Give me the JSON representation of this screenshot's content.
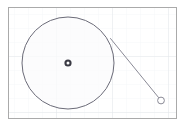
{
  "figure": {
    "type": "geometry-diagram",
    "canvas": {
      "width": 185,
      "height": 126,
      "background": "#ffffff"
    },
    "frame": {
      "label": "plot-frame",
      "x": 8.5,
      "y": 7.5,
      "width": 168,
      "height": 111,
      "stroke": "#aaaaaa",
      "stroke_width": 1,
      "fill": "#ffffff"
    },
    "grid": {
      "visible": true,
      "color": "#eef0f4",
      "spacing_x": 14,
      "spacing_y": 14,
      "stroke_width": 0.6,
      "major_color": "#e2e5ea",
      "major_every": 4
    },
    "shapes": {
      "main_circle": {
        "label": "main-circle",
        "cx": 68,
        "cy": 63,
        "r": 46,
        "stroke": "#6b6b78",
        "stroke_width": 1,
        "fill": "#fbfbfc"
      },
      "center_marker": {
        "label": "circle-center-point",
        "cx": 68,
        "cy": 63,
        "r_outer": 3.6,
        "r_inner": 1.5,
        "stroke": "#3a3a44",
        "stroke_width": 1.6,
        "fill": "#ffffff"
      },
      "tangent_line": {
        "label": "tangent-line",
        "x1": 110.5,
        "y1": 38.5,
        "x2": 161,
        "y2": 100.5,
        "stroke": "#8a8a96",
        "stroke_width": 1
      },
      "external_point": {
        "label": "external-point",
        "cx": 161,
        "cy": 100.5,
        "r": 3.4,
        "stroke": "#8a8a96",
        "stroke_width": 1,
        "fill": "#ffffff"
      }
    }
  },
  "chart_data": {
    "type": "scatter",
    "title": "",
    "xlabel": "",
    "ylabel": "",
    "grid": true,
    "legend": "none",
    "xlim": [
      0,
      168
    ],
    "ylim": [
      0,
      111
    ],
    "annotations": [
      {
        "name": "main-circle",
        "shape": "circle",
        "center": [
          68,
          63
        ],
        "radius": 46
      },
      {
        "name": "circle-center-point",
        "shape": "point",
        "center": [
          68,
          63
        ]
      },
      {
        "name": "tangent-line",
        "shape": "line",
        "from": [
          110.5,
          38.5
        ],
        "to": [
          161,
          100.5
        ]
      },
      {
        "name": "external-point",
        "shape": "point",
        "center": [
          161,
          100.5
        ]
      }
    ]
  }
}
